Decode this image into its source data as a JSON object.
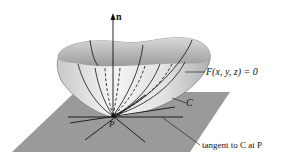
{
  "labels": {
    "normal": "n",
    "surface": "F(x, y, z) = 0",
    "curve": "C",
    "point": "P",
    "tangent": "tangent to C at P"
  },
  "colors": {
    "plane": "#9a9a9a",
    "surface_light": "#f2f2f2",
    "surface_dark": "#b8b8b8",
    "lines": "#111111"
  }
}
